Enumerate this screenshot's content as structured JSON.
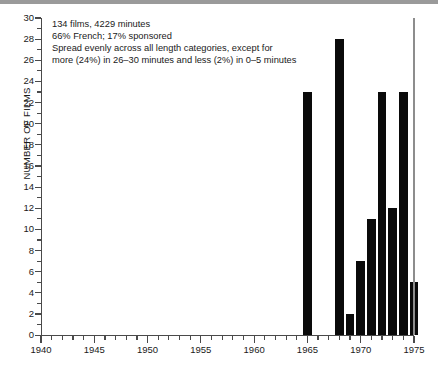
{
  "chart_data": {
    "type": "bar",
    "title": "",
    "subtitle": "",
    "xlabel": "",
    "ylabel": "NUMBER OF FILMS",
    "xlim": [
      1940,
      1975
    ],
    "ylim": [
      0,
      30
    ],
    "x_tick_step_major": 5,
    "x_tick_step_minor": 1,
    "y_tick_step_major": 2,
    "y_tick_step_minor": 1,
    "x_tick_labels": [
      "1940",
      "1945",
      "1950",
      "1955",
      "1960",
      "1965",
      "1970",
      "1975"
    ],
    "y_tick_labels": [
      "0",
      "2",
      "4",
      "6",
      "8",
      "10",
      "12",
      "14",
      "16",
      "18",
      "20",
      "22",
      "24",
      "26",
      "28",
      "30"
    ],
    "grid": false,
    "legend": null,
    "bar_color": "#0a0a0a",
    "axis_color": "#4a4a4a",
    "categories": [
      1965,
      1968,
      1969,
      1970,
      1971,
      1972,
      1973,
      1974,
      1975
    ],
    "values": [
      23,
      28,
      2,
      7,
      11,
      23,
      12,
      23,
      5
    ],
    "points": [
      {
        "x": 1965,
        "y": 23
      },
      {
        "x": 1968,
        "y": 28
      },
      {
        "x": 1969,
        "y": 2
      },
      {
        "x": 1970,
        "y": 7
      },
      {
        "x": 1971,
        "y": 11
      },
      {
        "x": 1972,
        "y": 23
      },
      {
        "x": 1973,
        "y": 12
      },
      {
        "x": 1974,
        "y": 23
      },
      {
        "x": 1975,
        "y": 5
      }
    ],
    "annotation_lines": [
      "134 films, 4229 minutes",
      "66% French; 17% sponsored",
      "Spread evenly across all length categories, except for",
      "more (24%) in 26–30 minutes and less (2%) in 0–5 minutes"
    ],
    "annotation_position": "top-left"
  }
}
